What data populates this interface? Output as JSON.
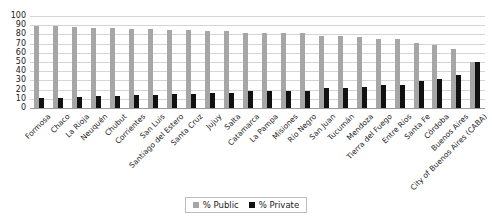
{
  "chart_data": {
    "type": "bar",
    "title": "",
    "subtitle": "",
    "xlabel": "",
    "ylabel": "",
    "ylim": [
      0,
      100
    ],
    "ytick_step": 10,
    "yticks": [
      100,
      90,
      80,
      70,
      60,
      50,
      40,
      30,
      20,
      10,
      0
    ],
    "grid": true,
    "grid_axis": "y",
    "legend_position": "bottom",
    "orientation": "vertical",
    "categories": [
      "Formosa",
      "Chaco",
      "La Rioja",
      "Neuquén",
      "Chubut",
      "Corrientes",
      "San Luis",
      "Santiago del Estero",
      "Santa Cruz",
      "Jujuy",
      "Salta",
      "Catamarca",
      "La Pampa",
      "Misiones",
      "Río Negro",
      "San Juan",
      "Tucumán",
      "Mendoza",
      "Tierra del Fuego",
      "Entre Ríos",
      "Santa Fe",
      "Córdoba",
      "Buenos Aires",
      "City of Buenos Aires (CABA)"
    ],
    "series": [
      {
        "name": "% Public",
        "color": "#a6a6a6",
        "values": [
          89,
          89,
          88,
          87,
          87,
          86,
          86,
          85,
          85,
          84,
          84,
          82,
          82,
          81,
          81,
          78,
          78,
          77,
          75,
          75,
          71,
          68,
          64,
          50
        ]
      },
      {
        "name": "% Private",
        "color": "#111111",
        "values": [
          11,
          11,
          12,
          13,
          13,
          14,
          14,
          15,
          15,
          16,
          16,
          18,
          18,
          19,
          19,
          22,
          22,
          23,
          25,
          25,
          29,
          32,
          36,
          50
        ]
      }
    ]
  },
  "legend": {
    "items": [
      {
        "label": "% Public",
        "swatch": "public"
      },
      {
        "label": "% Private",
        "swatch": "private"
      }
    ]
  }
}
